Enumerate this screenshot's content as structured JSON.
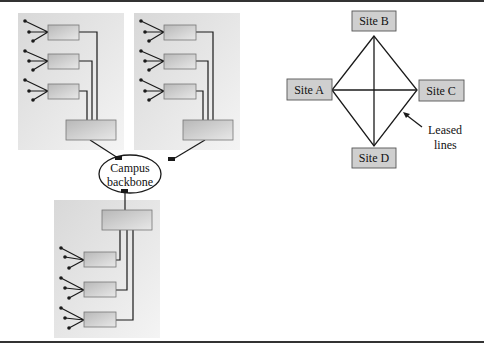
{
  "campus_network": {
    "backbone_label_line1": "Campus",
    "backbone_label_line2": "backbone",
    "buildings": 3,
    "switches_per_building": 3
  },
  "wan": {
    "sites": [
      {
        "label": "Site A"
      },
      {
        "label": "Site B"
      },
      {
        "label": "Site C"
      },
      {
        "label": "Site D"
      }
    ],
    "annotation_line1": "Leased",
    "annotation_line2": "lines"
  },
  "colors": {
    "building_bg": "#e4e4e4",
    "device_fill": "#c8c8c8",
    "site_fill": "#cfcfcf",
    "line": "#1a1a1a"
  }
}
